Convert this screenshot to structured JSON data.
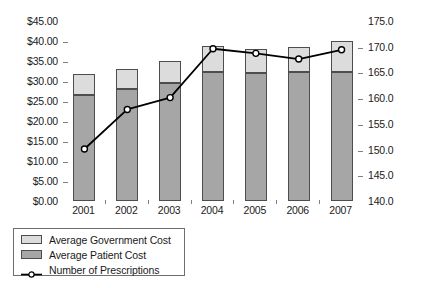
{
  "chart_data": {
    "type": "bar",
    "title": "",
    "subtitle": "",
    "xlabel": "",
    "ylabel": "",
    "categories": [
      "2001",
      "2002",
      "2003",
      "2004",
      "2005",
      "2006",
      "2007"
    ],
    "series": [
      {
        "name": "Average Patient Cost",
        "type": "bar",
        "stack": "cost",
        "axis": "left",
        "color": "#a6a6a6",
        "values": [
          26.5,
          28.0,
          29.5,
          32.25,
          32.0,
          32.25,
          32.25
        ]
      },
      {
        "name": "Average Government Cost",
        "type": "bar",
        "stack": "cost",
        "axis": "left",
        "color": "#dcdcdc",
        "values": [
          5.25,
          5.0,
          5.5,
          6.5,
          6.0,
          6.25,
          7.75
        ]
      },
      {
        "name": "Number of Prescriptions",
        "type": "line",
        "axis": "right",
        "color": "#000000",
        "marker": "open-circle",
        "values": [
          150.3,
          158.0,
          160.3,
          169.8,
          168.9,
          167.8,
          169.6
        ]
      }
    ],
    "stacked_totals": [
      31.75,
      33.0,
      35.0,
      38.75,
      38.0,
      38.5,
      40.0
    ],
    "left_axis": {
      "min": 0,
      "max": 45,
      "step": 5,
      "prefix": "$",
      "tick_labels": [
        "$0.00",
        "$5.00",
        "$10.00",
        "$15.00",
        "$20.00",
        "$25.00",
        "$30.00",
        "$35.00",
        "$40.00",
        "$45.00"
      ],
      "tick_values": [
        0,
        5,
        10,
        15,
        20,
        25,
        30,
        35,
        40,
        45
      ]
    },
    "right_axis": {
      "min": 140,
      "max": 175,
      "step": 5,
      "tick_labels": [
        "140.0",
        "145.0",
        "150.0",
        "155.0",
        "160.0",
        "165.0",
        "170.0",
        "175.0"
      ],
      "tick_values": [
        140,
        145,
        150,
        155,
        160,
        165,
        170,
        175
      ]
    },
    "grid": false,
    "legend_position": "bottom-left",
    "legend": [
      {
        "label": "Average Government Cost",
        "marker": "swatch",
        "color": "#dcdcdc"
      },
      {
        "label": "Average Patient Cost",
        "marker": "swatch",
        "color": "#a6a6a6"
      },
      {
        "label": "Number of Prescriptions",
        "marker": "line-open-circle",
        "color": "#000000"
      }
    ]
  },
  "colors": {
    "government_cost": "#dcdcdc",
    "patient_cost": "#a6a6a6",
    "prescriptions_line": "#000000",
    "bar_outline": "#4d4d4d",
    "frame": "#808080",
    "background": "#ffffff",
    "text": "#1a1a1a"
  }
}
